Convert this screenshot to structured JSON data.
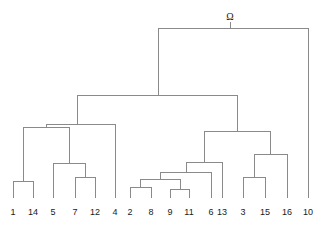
{
  "figure": {
    "kind": "dendrogram",
    "background_color": "#ffffff",
    "line_color": "#8a8a8a",
    "text_color": "#1a1a1a",
    "width": 324,
    "height": 237
  },
  "root": {
    "label": "Ω",
    "label_x": 230,
    "label_y": 20,
    "bar_y": 28,
    "stem_x": 230,
    "stem_top": 22,
    "left_x": 158,
    "right_x": 308
  },
  "leaves": [
    {
      "name": "1",
      "x": 13,
      "label_y": 215,
      "stem_top": 181
    },
    {
      "name": "14",
      "x": 33,
      "label_y": 215,
      "stem_top": 181
    },
    {
      "name": "5",
      "x": 53,
      "label_y": 215,
      "stem_top": 163
    },
    {
      "name": "7",
      "x": 75,
      "label_y": 215,
      "stem_top": 177
    },
    {
      "name": "12",
      "x": 95,
      "label_y": 215,
      "stem_top": 177
    },
    {
      "name": "4",
      "x": 115,
      "label_y": 215,
      "stem_top": 124
    },
    {
      "name": "2",
      "x": 130,
      "label_y": 215,
      "stem_top": 187
    },
    {
      "name": "8",
      "x": 151,
      "label_y": 215,
      "stem_top": 187
    },
    {
      "name": "9",
      "x": 170,
      "label_y": 215,
      "stem_top": 189
    },
    {
      "name": "11",
      "x": 189,
      "label_y": 215,
      "stem_top": 189
    },
    {
      "name": "6",
      "x": 211,
      "label_y": 215,
      "stem_top": 172
    },
    {
      "name": "13",
      "x": 222,
      "label_y": 215,
      "stem_top": 162
    },
    {
      "name": "3",
      "x": 243,
      "label_y": 215,
      "stem_top": 177
    },
    {
      "name": "15",
      "x": 265,
      "label_y": 215,
      "stem_top": 177
    },
    {
      "name": "16",
      "x": 287,
      "label_y": 215,
      "stem_top": 154
    },
    {
      "name": "10",
      "x": 308,
      "label_y": 215,
      "stem_top": 28
    }
  ],
  "leaf_baseline_y": 198,
  "merges": [
    {
      "id": "m-1-14",
      "members": "1,14",
      "y": 181,
      "left_x": 13,
      "right_x": 33,
      "parent_y": 127,
      "stem_x": 23
    },
    {
      "id": "m-7-12",
      "members": "7,12",
      "y": 177,
      "left_x": 75,
      "right_x": 95,
      "parent_y": 163,
      "stem_x": 85
    },
    {
      "id": "m-5-712",
      "members": "5,7,12",
      "y": 163,
      "left_x": 53,
      "right_x": 85,
      "parent_y": 127,
      "stem_x": 69
    },
    {
      "id": "m-left-inner",
      "members": "1,14,5,7,12",
      "y": 127,
      "left_x": 23,
      "right_x": 69,
      "parent_y": 124,
      "stem_x": 46
    },
    {
      "id": "m-left-outer",
      "members": "1,14,5,7,12,4",
      "y": 124,
      "left_x": 46,
      "right_x": 115,
      "parent_y": 95,
      "stem_x": 77
    },
    {
      "id": "m-2-8",
      "members": "2,8",
      "y": 187,
      "left_x": 130,
      "right_x": 151,
      "parent_y": 179,
      "stem_x": 140
    },
    {
      "id": "m-9-11",
      "members": "9,11",
      "y": 189,
      "left_x": 170,
      "right_x": 189,
      "parent_y": 179,
      "stem_x": 180
    },
    {
      "id": "m-28-911",
      "members": "2,8,9,11",
      "y": 179,
      "left_x": 140,
      "right_x": 180,
      "parent_y": 172,
      "stem_x": 160
    },
    {
      "id": "m-28911-6",
      "members": "2,8,9,11,6",
      "y": 172,
      "left_x": 160,
      "right_x": 211,
      "parent_y": 162,
      "stem_x": 186
    },
    {
      "id": "m-right-13",
      "members": "2,8,9,11,6,13",
      "y": 162,
      "left_x": 186,
      "right_x": 222,
      "parent_y": 131,
      "stem_x": 204
    },
    {
      "id": "m-3-15",
      "members": "3,15",
      "y": 177,
      "left_x": 243,
      "right_x": 265,
      "parent_y": 154,
      "stem_x": 254
    },
    {
      "id": "m-315-16",
      "members": "3,15,16",
      "y": 154,
      "left_x": 254,
      "right_x": 287,
      "parent_y": 131,
      "stem_x": 270
    },
    {
      "id": "m-right-outer",
      "members": "2,8,9,11,6,13,3,15,16",
      "y": 131,
      "left_x": 204,
      "right_x": 270,
      "parent_y": 95,
      "stem_x": 237
    },
    {
      "id": "m-main",
      "members": "all but 10",
      "y": 95,
      "left_x": 77,
      "right_x": 237,
      "parent_y": 28,
      "stem_x": 158
    },
    {
      "id": "m-root",
      "members": "all",
      "y": 28,
      "left_x": 158,
      "right_x": 308,
      "parent_y": 22,
      "stem_x": 230
    }
  ]
}
